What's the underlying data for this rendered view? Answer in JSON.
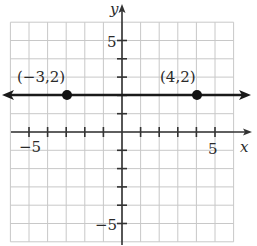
{
  "chart_data": {
    "type": "line",
    "title": "",
    "xlabel": "x",
    "ylabel": "y",
    "xlim": [
      -6,
      6
    ],
    "ylim": [
      -6,
      6
    ],
    "grid": true,
    "x_ticks": [
      -5,
      -4,
      -3,
      -2,
      -1,
      1,
      2,
      3,
      4,
      5
    ],
    "y_ticks": [
      -5,
      -4,
      -3,
      -2,
      -1,
      1,
      2,
      3,
      4,
      5
    ],
    "x_tick_labels": [
      {
        "value": -5,
        "label": "−5"
      },
      {
        "value": 5,
        "label": "5"
      }
    ],
    "y_tick_labels": [
      {
        "value": 5,
        "label": "5"
      },
      {
        "value": -5,
        "label": "−5"
      }
    ],
    "series": [
      {
        "name": "y = 2",
        "kind": "horizontal-line-with-arrows",
        "equation": "y = 2",
        "x": [
          -6,
          6
        ],
        "y": [
          2,
          2
        ]
      }
    ],
    "points": [
      {
        "x": -3,
        "y": 2,
        "label": "(−3,2)"
      },
      {
        "x": 4,
        "y": 2,
        "label": "(4,2)"
      }
    ]
  },
  "labels": {
    "x_axis": "x",
    "y_axis": "y",
    "x_neg5": "−5",
    "x_pos5": "5",
    "y_pos5": "5",
    "y_neg5": "−5",
    "point_a": "(−3,2)",
    "point_b": "(4,2)"
  },
  "colors": {
    "grid": "#c8c8c8",
    "axis": "#333333",
    "line": "#1a1a1a",
    "point": "#111111"
  }
}
